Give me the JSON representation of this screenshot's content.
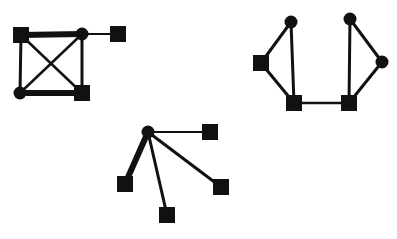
{
  "diagram": {
    "type": "graph-networks",
    "color": "#111111",
    "background": "#ffffff",
    "graphs": [
      {
        "name": "complete-graph-with-pendant",
        "nodes": [
          {
            "id": "a",
            "shape": "square",
            "x": 21,
            "y": 35
          },
          {
            "id": "b",
            "shape": "circle",
            "x": 82,
            "y": 34
          },
          {
            "id": "c",
            "shape": "square",
            "x": 118,
            "y": 34
          },
          {
            "id": "d",
            "shape": "circle",
            "x": 20,
            "y": 93
          },
          {
            "id": "e",
            "shape": "square",
            "x": 82,
            "y": 93
          }
        ],
        "edges": [
          {
            "from": "a",
            "to": "b",
            "width": 6
          },
          {
            "from": "b",
            "to": "c",
            "width": 2
          },
          {
            "from": "a",
            "to": "d",
            "width": 3
          },
          {
            "from": "a",
            "to": "e",
            "width": 2.5
          },
          {
            "from": "b",
            "to": "d",
            "width": 2.5
          },
          {
            "from": "b",
            "to": "e",
            "width": 3
          },
          {
            "from": "d",
            "to": "e",
            "width": 6
          }
        ]
      },
      {
        "name": "two-triangles-bridge",
        "nodes": [
          {
            "id": "f",
            "shape": "circle",
            "x": 291,
            "y": 22
          },
          {
            "id": "g",
            "shape": "square",
            "x": 261,
            "y": 63
          },
          {
            "id": "h",
            "shape": "square",
            "x": 294,
            "y": 103
          },
          {
            "id": "i",
            "shape": "square",
            "x": 349,
            "y": 103
          },
          {
            "id": "j",
            "shape": "circle",
            "x": 350,
            "y": 19
          },
          {
            "id": "k",
            "shape": "circle",
            "x": 382,
            "y": 62
          }
        ],
        "edges": [
          {
            "from": "f",
            "to": "g",
            "width": 3
          },
          {
            "from": "f",
            "to": "h",
            "width": 3
          },
          {
            "from": "g",
            "to": "h",
            "width": 3
          },
          {
            "from": "h",
            "to": "i",
            "width": 2.5
          },
          {
            "from": "j",
            "to": "i",
            "width": 3
          },
          {
            "from": "j",
            "to": "k",
            "width": 3
          },
          {
            "from": "k",
            "to": "i",
            "width": 3
          }
        ]
      },
      {
        "name": "star-graph",
        "nodes": [
          {
            "id": "m",
            "shape": "circle",
            "x": 148,
            "y": 132
          },
          {
            "id": "n",
            "shape": "square",
            "x": 210,
            "y": 132
          },
          {
            "id": "o",
            "shape": "square",
            "x": 125,
            "y": 184
          },
          {
            "id": "p",
            "shape": "square",
            "x": 167,
            "y": 215
          },
          {
            "id": "q",
            "shape": "square",
            "x": 221,
            "y": 187
          }
        ],
        "edges": [
          {
            "from": "m",
            "to": "n",
            "width": 2
          },
          {
            "from": "m",
            "to": "o",
            "width": 6
          },
          {
            "from": "m",
            "to": "p",
            "width": 3
          },
          {
            "from": "m",
            "to": "q",
            "width": 3
          }
        ]
      }
    ],
    "node_size": {
      "square": 16,
      "circle_radius": 6.5
    }
  }
}
